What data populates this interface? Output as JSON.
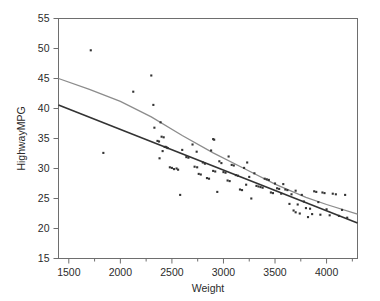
{
  "chart_data": {
    "type": "scatter",
    "title": "",
    "subtitle": "",
    "xlabel": "Weight",
    "ylabel": "HighwayMPG",
    "xlim": [
      1400,
      4300
    ],
    "ylim": [
      15,
      55
    ],
    "xticks": [
      1500,
      2000,
      2500,
      3000,
      3500,
      4000
    ],
    "xtick_labels": [
      "1500",
      "2000",
      "2500",
      "3000",
      "3500",
      "4000"
    ],
    "xminor_ticks": [
      1750,
      2250,
      2750,
      3250,
      3750,
      4250
    ],
    "yticks": [
      15,
      20,
      25,
      30,
      35,
      40,
      45,
      50,
      55
    ],
    "ytick_labels": [
      "15",
      "20",
      "25",
      "30",
      "35",
      "40",
      "45",
      "50",
      "55"
    ],
    "grid": false,
    "legend": "none",
    "frame": true,
    "marker": "square-dot",
    "marker_color": "#333333",
    "marker_size": 2.1,
    "points": [
      [
        1713,
        49.7
      ],
      [
        1835,
        32.6
      ],
      [
        2125,
        42.8
      ],
      [
        2300,
        45.5
      ],
      [
        2320,
        40.6
      ],
      [
        2330,
        36.8
      ],
      [
        2360,
        34.6
      ],
      [
        2375,
        34.5
      ],
      [
        2390,
        37.7
      ],
      [
        2400,
        35.3
      ],
      [
        2420,
        35.2
      ],
      [
        2430,
        33.6
      ],
      [
        2440,
        33.6
      ],
      [
        2450,
        33.5
      ],
      [
        2460,
        33.4
      ],
      [
        2480,
        30.2
      ],
      [
        2500,
        30.1
      ],
      [
        2520,
        29.9
      ],
      [
        2545,
        30.0
      ],
      [
        2560,
        29.8
      ],
      [
        2580,
        25.6
      ],
      [
        2600,
        33.1
      ],
      [
        2640,
        31.9
      ],
      [
        2660,
        31.8
      ],
      [
        2700,
        34.0
      ],
      [
        2720,
        30.3
      ],
      [
        2745,
        30.2
      ],
      [
        2760,
        29.1
      ],
      [
        2780,
        29.0
      ],
      [
        2800,
        31.0
      ],
      [
        2820,
        30.8
      ],
      [
        2840,
        28.4
      ],
      [
        2860,
        28.3
      ],
      [
        2880,
        33.0
      ],
      [
        2900,
        29.6
      ],
      [
        2920,
        29.5
      ],
      [
        2940,
        26.1
      ],
      [
        2960,
        31.2
      ],
      [
        2980,
        30.9
      ],
      [
        3000,
        29.4
      ],
      [
        3020,
        29.3
      ],
      [
        3040,
        28.0
      ],
      [
        3060,
        27.9
      ],
      [
        3080,
        30.6
      ],
      [
        3100,
        30.5
      ],
      [
        3120,
        28.9
      ],
      [
        3140,
        28.8
      ],
      [
        3160,
        26.5
      ],
      [
        3180,
        26.4
      ],
      [
        3200,
        30.1
      ],
      [
        3220,
        27.3
      ],
      [
        3250,
        28.6
      ],
      [
        3270,
        25.0
      ],
      [
        3300,
        29.2
      ],
      [
        3320,
        27.1
      ],
      [
        3340,
        27.0
      ],
      [
        3360,
        26.9
      ],
      [
        3380,
        26.8
      ],
      [
        3400,
        28.3
      ],
      [
        3420,
        28.2
      ],
      [
        3440,
        28.1
      ],
      [
        3460,
        26.0
      ],
      [
        3480,
        25.9
      ],
      [
        3500,
        27.5
      ],
      [
        3520,
        26.7
      ],
      [
        3540,
        26.6
      ],
      [
        3560,
        25.8
      ],
      [
        3580,
        27.4
      ],
      [
        3600,
        26.5
      ],
      [
        3620,
        26.4
      ],
      [
        3640,
        24.1
      ],
      [
        3660,
        25.7
      ],
      [
        3680,
        23.0
      ],
      [
        3700,
        26.3
      ],
      [
        3720,
        24.0
      ],
      [
        3740,
        22.5
      ],
      [
        3760,
        25.6
      ],
      [
        3780,
        24.5
      ],
      [
        3800,
        23.4
      ],
      [
        3820,
        21.9
      ],
      [
        3840,
        23.3
      ],
      [
        3860,
        22.4
      ],
      [
        3880,
        26.2
      ],
      [
        3900,
        26.1
      ],
      [
        3920,
        24.4
      ],
      [
        3940,
        22.3
      ],
      [
        3960,
        26.0
      ],
      [
        3980,
        25.9
      ],
      [
        4000,
        23.2
      ],
      [
        4030,
        22.2
      ],
      [
        4060,
        25.8
      ],
      [
        4090,
        25.7
      ],
      [
        4120,
        22.1
      ],
      [
        4150,
        23.1
      ],
      [
        4180,
        25.6
      ],
      [
        4200,
        21.8
      ],
      [
        2900,
        34.9
      ],
      [
        2910,
        34.8
      ],
      [
        3050,
        32.0
      ],
      [
        3230,
        31.0
      ],
      [
        2380,
        31.7
      ],
      [
        2410,
        32.9
      ],
      [
        2740,
        32.8
      ],
      [
        3700,
        22.7
      ]
    ],
    "lines": [
      {
        "name": "smoothed-fit",
        "color": "#8c8c8c",
        "width": 1.3,
        "points": [
          [
            1400,
            45.0
          ],
          [
            1700,
            43.2
          ],
          [
            2000,
            41.2
          ],
          [
            2300,
            38.6
          ],
          [
            2600,
            35.5
          ],
          [
            2900,
            32.6
          ],
          [
            3200,
            30.0
          ],
          [
            3500,
            27.4
          ],
          [
            3800,
            25.2
          ],
          [
            4000,
            24.0
          ],
          [
            4300,
            22.4
          ]
        ]
      },
      {
        "name": "linear-regression-fit",
        "color": "#333333",
        "width": 1.6,
        "points": [
          [
            1400,
            40.6
          ],
          [
            4300,
            20.9
          ]
        ]
      }
    ]
  },
  "axes": {
    "x_axis_name": "Weight",
    "y_axis_name": "HighwayMPG"
  }
}
